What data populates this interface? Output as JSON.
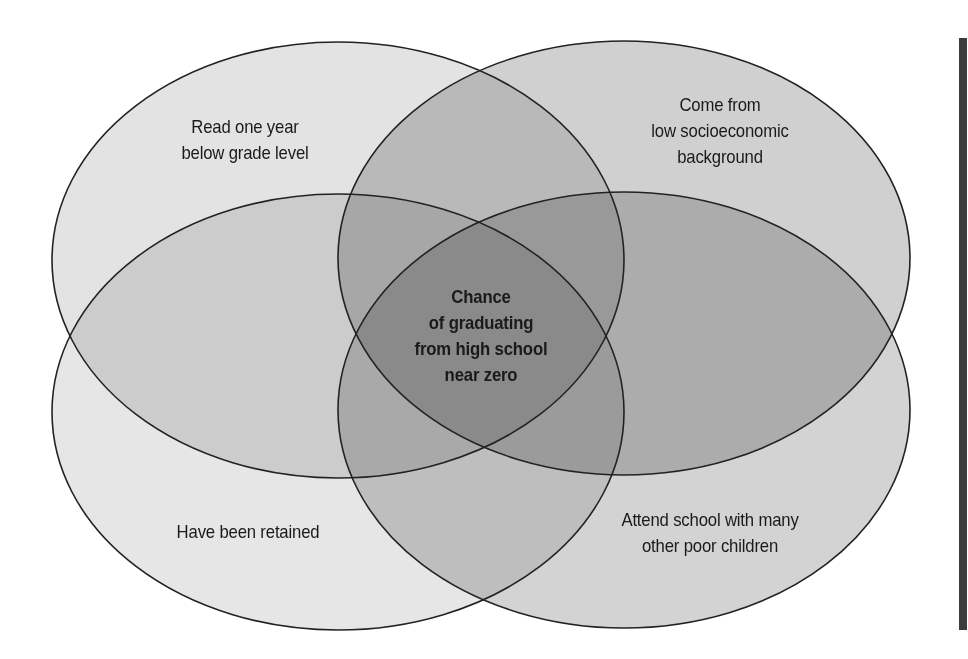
{
  "diagram": {
    "type": "venn",
    "sets": [
      {
        "id": "reading",
        "label_lines": [
          "Read one year",
          "below grade level"
        ],
        "fill": "#e3e3e3",
        "cx": 338,
        "cy": 260,
        "rx": 286,
        "ry": 218
      },
      {
        "id": "socioeconomic",
        "label_lines": [
          "Come from",
          "low socioeconomic",
          "background"
        ],
        "fill": "#d0d0d0",
        "cx": 624,
        "cy": 258,
        "rx": 286,
        "ry": 217
      },
      {
        "id": "retained",
        "label_lines": [
          "Have been retained"
        ],
        "fill": "#e6e6e6",
        "cx": 338,
        "cy": 412,
        "rx": 286,
        "ry": 218
      },
      {
        "id": "poor_school",
        "label_lines": [
          "Attend school with many",
          "other poor children"
        ],
        "fill": "#d3d3d3",
        "cx": 624,
        "cy": 410,
        "rx": 286,
        "ry": 218
      }
    ],
    "center": {
      "label_lines": [
        "Chance",
        "of graduating",
        "from high school",
        "near zero"
      ]
    },
    "outline_color": "#222222",
    "side_bar_color": "#3c3c3c"
  }
}
